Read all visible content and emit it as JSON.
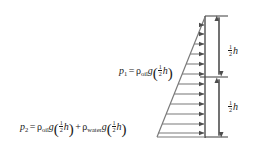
{
  "figure": {
    "width": 269,
    "height": 160,
    "background_color": "#ffffff",
    "line_color": "#4d4d4d",
    "text_color": "#1a1a1a"
  },
  "equations": {
    "p1": {
      "lhs": "p",
      "lhs_sub": "1",
      "equals": "=",
      "rho1": "ρ",
      "rho1_sub": "oil",
      "g1": "g",
      "paren_open": "(",
      "frac_num": "1",
      "frac_den": "2",
      "h1": "h",
      "paren_close": ")",
      "plain_text": "p₁ = ρ_oil g(½ h)"
    },
    "p2": {
      "lhs": "p",
      "lhs_sub": "2",
      "equals": "=",
      "rho1": "ρ",
      "rho1_sub": "oil",
      "g1": "g",
      "paren_open": "(",
      "frac_num": "1",
      "frac_den": "2",
      "h1": "h",
      "paren_close": ")",
      "plus": "+",
      "rho2": "ρ",
      "rho2_sub": "water",
      "g2": "g",
      "paren_open2": "(",
      "frac_num2": "1",
      "frac_den2": "2",
      "h2": "h",
      "paren_close2": ")",
      "plain_text": "p₂ = ρ_oil g(½ h) + ρ_water g(½ h)"
    }
  },
  "dimensions": {
    "top": {
      "frac_num": "1",
      "frac_den": "2",
      "symbol": "h",
      "plain_text": "½ h"
    },
    "bottom": {
      "frac_num": "1",
      "frac_den": "2",
      "symbol": "h",
      "plain_text": "½ h"
    }
  },
  "geometry": {
    "wall_x": 205,
    "wall_top_y": 17,
    "wall_bottom_y": 137,
    "apex_x": 205,
    "apex_y": 17,
    "base_left_x": 157,
    "base_y": 137,
    "arrow_count": 12,
    "dim_line_x": 219,
    "dim_mid_y": 77
  }
}
